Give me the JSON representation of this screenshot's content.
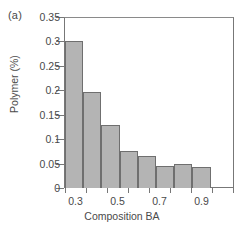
{
  "panel": {
    "label": "(a)"
  },
  "colors": {
    "bar_fill": "#b4b4b4",
    "bar_stroke": "#6f6f6f",
    "axis": "#777777",
    "text": "#4a4a4a"
  },
  "chart_data": {
    "type": "bar",
    "title": "",
    "xlabel": "Composition BA",
    "ylabel": "Polymer (%)",
    "ylim": [
      0,
      0.35
    ],
    "ytick_labels": [
      "0.35",
      "0.3",
      "0.25",
      "0.2",
      "0.15",
      "0.1",
      "0.05",
      "0"
    ],
    "ytick_values": [
      0.35,
      0.3,
      0.25,
      0.2,
      0.15,
      0.1,
      0.05,
      0
    ],
    "xtick_labels": [
      "0.3",
      "0.5",
      "0.7",
      "0.9"
    ],
    "xtick_values": [
      0.3,
      0.5,
      0.7,
      0.9
    ],
    "categories": [
      "0.3",
      "0.4",
      "0.5",
      "0.6",
      "0.7",
      "0.8",
      "0.9",
      "1.0"
    ],
    "values": [
      0.301,
      0.196,
      0.128,
      0.075,
      0.066,
      0.045,
      0.049,
      0.044
    ],
    "grid": false,
    "legend": "none"
  }
}
